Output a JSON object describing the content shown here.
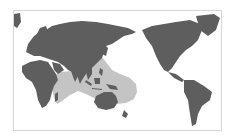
{
  "map": {
    "projection": "Pacific-centered world map",
    "colors": {
      "background": "#ffffff",
      "ocean": "#ffffff",
      "land": "#5e5e5e",
      "range": "#c4c4c4",
      "frame": "#d6d6d6"
    },
    "layers": [
      {
        "name": "land",
        "description": "World continents in dark gray"
      },
      {
        "name": "distribution-range",
        "description": "Light gray shaded range covering Indian Ocean and western Pacific (East Africa to Southeast Asia, Indonesia, northern Australia, Melanesia)"
      }
    ]
  }
}
